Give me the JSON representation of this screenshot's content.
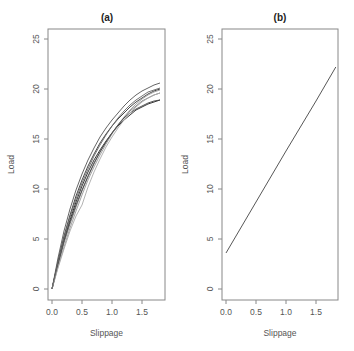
{
  "chart_data": [
    {
      "type": "line",
      "title": "(a)",
      "xlabel": "Slippage",
      "ylabel": "Load",
      "xlim": [
        -0.08,
        1.9
      ],
      "ylim": [
        -1.1,
        26
      ],
      "xticks": [
        0.0,
        0.5,
        1.0,
        1.5
      ],
      "xtick_labels": [
        "0.0",
        "0.5",
        "1.0",
        "1.5"
      ],
      "yticks": [
        0,
        5,
        10,
        15,
        20,
        25
      ],
      "ytick_labels": [
        "0",
        "5",
        "10",
        "15",
        "20",
        "25"
      ],
      "grid": false,
      "legend": null,
      "x": [
        0.0,
        0.1,
        0.2,
        0.3,
        0.4,
        0.5,
        0.6,
        0.7,
        0.8,
        0.9,
        1.0,
        1.1,
        1.2,
        1.3,
        1.4,
        1.5,
        1.6,
        1.7,
        1.8
      ],
      "series": [
        {
          "name": "curve-1",
          "color": "#222222",
          "values": [
            0.0,
            2.6,
            4.9,
            6.9,
            8.7,
            10.3,
            11.7,
            12.9,
            13.9,
            14.8,
            15.6,
            16.3,
            16.9,
            17.4,
            17.9,
            18.2,
            18.5,
            18.7,
            18.9
          ]
        },
        {
          "name": "curve-2",
          "color": "#333333",
          "values": [
            0.0,
            2.8,
            5.3,
            7.4,
            9.3,
            10.9,
            12.3,
            13.5,
            14.6,
            15.5,
            16.3,
            17.0,
            17.6,
            18.2,
            18.7,
            19.1,
            19.5,
            19.8,
            20.0
          ]
        },
        {
          "name": "curve-3",
          "color": "#555555",
          "values": [
            0.0,
            3.1,
            5.8,
            8.0,
            9.9,
            11.5,
            12.9,
            14.1,
            15.2,
            16.1,
            16.9,
            17.6,
            18.3,
            18.9,
            19.4,
            19.8,
            20.1,
            20.4,
            20.6
          ]
        },
        {
          "name": "curve-4",
          "color": "#777777",
          "values": [
            0.0,
            2.4,
            4.6,
            6.5,
            8.2,
            9.8,
            11.2,
            12.5,
            13.7,
            14.7,
            15.6,
            16.4,
            17.1,
            17.8,
            18.3,
            18.8,
            19.1,
            19.4,
            19.6
          ]
        },
        {
          "name": "curve-5",
          "color": "#999999",
          "values": [
            0.0,
            2.2,
            4.2,
            6.1,
            7.8,
            9.4,
            10.9,
            12.2,
            13.4,
            14.5,
            15.5,
            16.4,
            17.2,
            17.9,
            18.5,
            19.0,
            19.4,
            19.7,
            19.9
          ]
        },
        {
          "name": "curve-6",
          "color": "#444444",
          "values": [
            0.0,
            2.5,
            4.8,
            6.7,
            8.4,
            9.9,
            11.3,
            12.6,
            13.7,
            14.7,
            15.6,
            16.4,
            17.1,
            17.6,
            18.0,
            18.3,
            18.6,
            18.8,
            18.9
          ]
        },
        {
          "name": "curve-7",
          "color": "#aaaaaa",
          "values": [
            0.0,
            2.1,
            4.0,
            5.8,
            7.3,
            8.4,
            10.2,
            11.7,
            13.0,
            14.2,
            15.2,
            16.1,
            16.9,
            17.6,
            18.2,
            18.7,
            19.1,
            19.4,
            19.6
          ]
        },
        {
          "name": "curve-8",
          "color": "#666666",
          "values": [
            0.0,
            2.7,
            5.1,
            7.2,
            9.0,
            10.6,
            12.0,
            13.3,
            14.4,
            15.4,
            16.3,
            17.1,
            17.8,
            18.4,
            18.9,
            19.3,
            19.7,
            19.9,
            20.1
          ]
        }
      ]
    },
    {
      "type": "line",
      "title": "(b)",
      "xlabel": "Slippage",
      "ylabel": "Load",
      "xlim": [
        -0.08,
        1.9
      ],
      "ylim": [
        -1.1,
        26
      ],
      "xticks": [
        0.0,
        0.5,
        1.0,
        1.5
      ],
      "xtick_labels": [
        "0.0",
        "0.5",
        "1.0",
        "1.5"
      ],
      "yticks": [
        0,
        5,
        10,
        15,
        20,
        25
      ],
      "ytick_labels": [
        "0",
        "5",
        "10",
        "15",
        "20",
        "25"
      ],
      "grid": false,
      "legend": null,
      "x": [
        0.0,
        0.5,
        1.0,
        1.5,
        1.83
      ],
      "series": [
        {
          "name": "fitted-line",
          "color": "#444444",
          "values": [
            3.6,
            8.7,
            13.8,
            18.8,
            22.2
          ]
        }
      ]
    }
  ],
  "panels": [
    {
      "title": "(a)",
      "xlabel": "Slippage",
      "ylabel": "Load"
    },
    {
      "title": "(b)",
      "xlabel": "Slippage",
      "ylabel": "Load"
    }
  ]
}
